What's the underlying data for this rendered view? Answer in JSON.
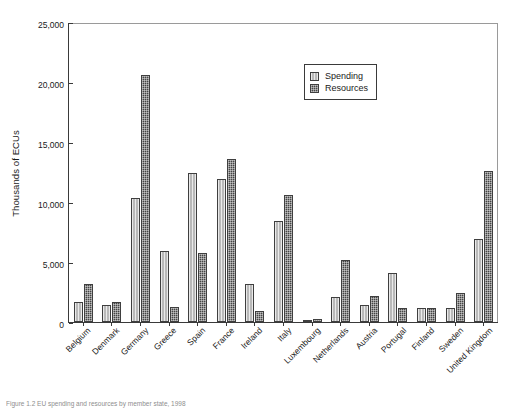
{
  "figure": {
    "caption": "Figure 1.2  EU spending and resources by member state, 1998"
  },
  "legend": {
    "position": "inside-top-right",
    "entries": [
      {
        "label": "Spending",
        "icon": "legend-swatch-spending",
        "color": "#b9b9b9"
      },
      {
        "label": "Resources",
        "icon": "legend-swatch-resources",
        "color": "#454545"
      }
    ]
  },
  "axes": {
    "ylabel": "Thousands of ECUs",
    "xlabel": "",
    "yticks": [
      "0",
      "5,000",
      "10,000",
      "15,000",
      "20,000",
      "25,000"
    ],
    "ytick_values": [
      0,
      5000,
      10000,
      15000,
      20000,
      25000
    ],
    "ylim": [
      0,
      25000
    ],
    "grid": false
  },
  "chart_data": {
    "type": "bar",
    "title": "",
    "subtitle": "",
    "xlabel": "",
    "ylabel": "Thousands of ECUs",
    "ylim": [
      0,
      25000
    ],
    "grid": false,
    "legend_position": "inside-top-right",
    "categories": [
      "Belgium",
      "Denmark",
      "Germany",
      "Greece",
      "Spain",
      "France",
      "Ireland",
      "Italy",
      "Luxembourg",
      "Netherlands",
      "Austria",
      "Portugal",
      "Finland",
      "Sweden",
      "United Kingdom"
    ],
    "series": [
      {
        "name": "Spending",
        "color": "#b9b9b9",
        "values": [
          1650,
          1450,
          10350,
          5900,
          12400,
          11900,
          3200,
          8400,
          150,
          2050,
          1400,
          4050,
          1150,
          1200,
          6900
        ]
      },
      {
        "name": "Resources",
        "color": "#454545",
        "values": [
          3150,
          1650,
          20600,
          1250,
          5750,
          13600,
          950,
          10600,
          250,
          5150,
          2200,
          1200,
          1200,
          2400,
          12600
        ]
      }
    ]
  }
}
